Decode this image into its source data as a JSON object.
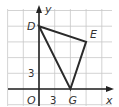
{
  "diagram": {
    "type": "coordinate-grid-triangle",
    "axes": {
      "x_label": "x",
      "y_label": "y",
      "origin_label": "O"
    },
    "grid": {
      "unit_per_cell": 3,
      "x_cells": [
        -2,
        4
      ],
      "y_cells": [
        -1,
        5
      ]
    },
    "tick_labels": {
      "x": "3",
      "y": "3"
    },
    "vertices": [
      {
        "name": "D",
        "x": 0,
        "y": 12
      },
      {
        "name": "E",
        "x": 9,
        "y": 9
      },
      {
        "name": "G",
        "x": 6,
        "y": 0
      }
    ],
    "colors": {
      "grid": "#c8c8c8",
      "lines": "#2a2a2a",
      "text": "#333333"
    }
  }
}
